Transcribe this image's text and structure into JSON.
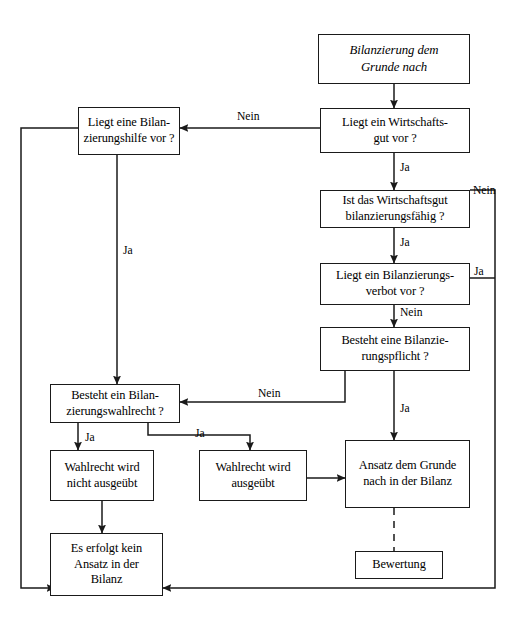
{
  "diagram": {
    "title": "Bilanzierung dem Grunde nach",
    "language": "de",
    "type": "flowchart",
    "background_color": "#ffffff",
    "line_color": "#1a1a1a",
    "text_color": "#000000"
  },
  "nodes": {
    "title": {
      "line1": "Bilanzierung dem",
      "line2": "Grunde nach"
    },
    "wirtschaftsgut": {
      "line1": "Liegt ein Wirtschafts-",
      "line2": "gut vor  ?"
    },
    "bilanzierungshilfe": {
      "line1": "Liegt eine Bilan-",
      "line2": "zierungshilfe vor  ?"
    },
    "bilanzierungsfaehig": {
      "line1": "Ist das Wirtschaftsgut",
      "line2": "bilanzierungsfähig ?"
    },
    "bilanzierungsverbot": {
      "line1": "Liegt ein Bilanzierungs-",
      "line2": "verbot vor  ?"
    },
    "bilanzierungspflicht": {
      "line1": "Besteht eine Bilanzie-",
      "line2": "rungspflicht ?"
    },
    "bilanzierungswahlrecht": {
      "line1": "Besteht ein Bilan-",
      "line2": "zierungswahlrecht ?"
    },
    "wahlrecht_nicht": {
      "line1": "Wahlrecht wird",
      "line2": "nicht ausgeübt"
    },
    "wahlrecht_ausgeuebt": {
      "line1": "Wahlrecht wird",
      "line2": "ausgeübt"
    },
    "ansatz": {
      "line1": "Ansatz dem Grunde",
      "line2": "nach in der Bilanz"
    },
    "bewertung": {
      "line1": "Bewertung"
    },
    "kein_ansatz": {
      "line1": "Es erfolgt kein",
      "line2": "Ansatz in der",
      "line3": "Bilanz"
    }
  },
  "edge_labels": {
    "wirtschaftsgut_nein": "Nein",
    "wirtschaftsgut_ja": "Ja",
    "bilanzierungshilfe_ja": "Ja",
    "bilanzierungsfaehig_nein": "Nein",
    "bilanzierungsfaehig_ja": "Ja",
    "bilanzierungsverbot_ja": "Ja",
    "bilanzierungsverbot_nein": "Nein",
    "bilanzierungspflicht_nein": "Nein",
    "bilanzierungspflicht_ja": "Ja",
    "wahlrecht_ja_left": "Ja",
    "wahlrecht_ja_right": "Ja"
  }
}
